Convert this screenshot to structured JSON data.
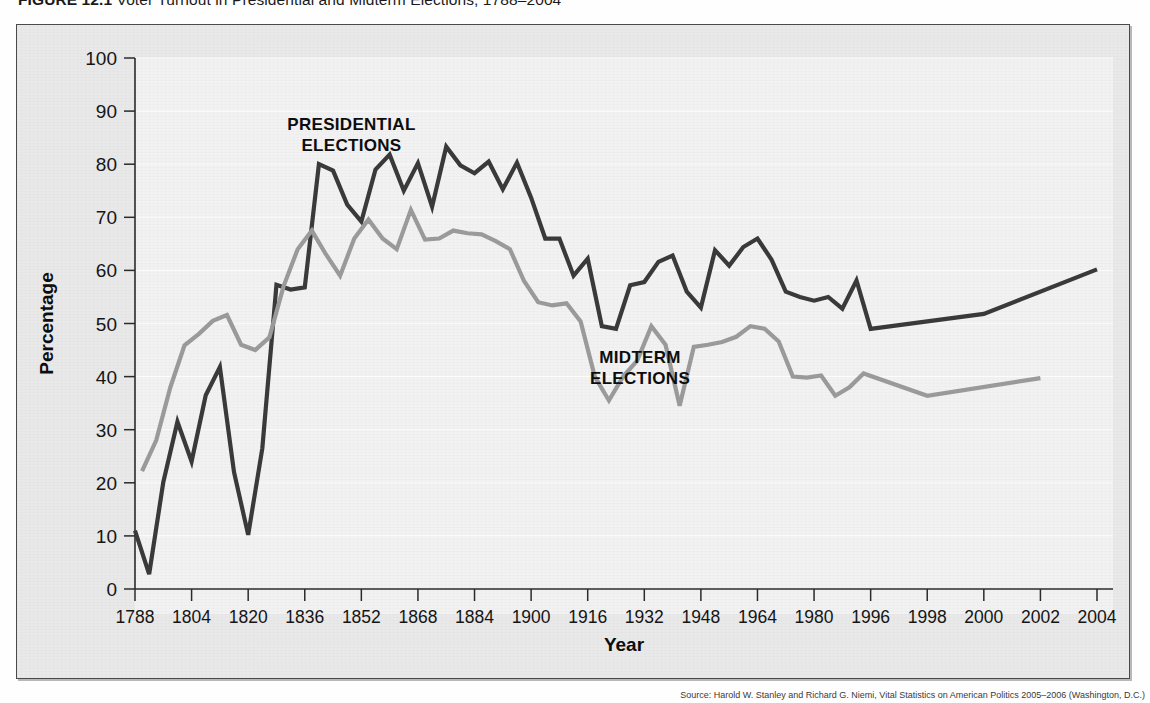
{
  "caption": {
    "number": "FIGURE 12.1",
    "title": "Voter Turnout in Presidential and Midterm Elections, 1788–2004"
  },
  "source": {
    "text": "Source: Harold W. Stanley and Richard G. Niemi, Vital Statistics on American Politics 2005–2006 (Washington, D.C.)"
  },
  "colors": {
    "presidential_line": "#3a3a3a",
    "midterm_line": "#9b9b9b",
    "plot_background": "#f2f2f2",
    "frame_background": "#e9e9e9",
    "axis": "#2b2b2b",
    "gridline": "#ffffff"
  },
  "chart_data": {
    "type": "line",
    "title": "Voter Turnout in Presidential and Midterm Elections",
    "xlabel": "Year",
    "ylabel": "Percentage",
    "ylim": [
      0,
      100
    ],
    "ytick_labels": [
      "0",
      "10",
      "20",
      "30",
      "40",
      "50",
      "60",
      "70",
      "80",
      "90",
      "100"
    ],
    "ytick_values": [
      0,
      10,
      20,
      30,
      40,
      50,
      60,
      70,
      80,
      90,
      100
    ],
    "xtick_labels": [
      "1788",
      "1804",
      "1820",
      "1836",
      "1852",
      "1868",
      "1884",
      "1900",
      "1916",
      "1932",
      "1948",
      "1964",
      "1980",
      "1996",
      "1998",
      "2000",
      "2002",
      "2004"
    ],
    "grid": "horizontal",
    "legend_position": "inline-annotations",
    "annotations": [
      {
        "text": "PRESIDENTIAL\nELECTIONS",
        "line1": "PRESIDENTIAL",
        "line2": "ELECTIONS",
        "x_frac": 0.225,
        "y_frac": 0.135
      },
      {
        "text": "MIDTERM\nELECTIONS",
        "line1": "MIDTERM",
        "line2": "ELECTIONS",
        "x_frac": 0.525,
        "y_frac": 0.575
      }
    ],
    "series": [
      {
        "name": "Presidential Elections",
        "color": "#3a3a3a",
        "stroke_width": 4.2,
        "points": [
          [
            1788,
            11.0
          ],
          [
            1792,
            2.8
          ],
          [
            1796,
            20.1
          ],
          [
            1800,
            31.5
          ],
          [
            1804,
            24.0
          ],
          [
            1808,
            36.5
          ],
          [
            1812,
            41.8
          ],
          [
            1816,
            22.0
          ],
          [
            1820,
            10.2
          ],
          [
            1824,
            26.5
          ],
          [
            1828,
            57.3
          ],
          [
            1832,
            56.4
          ],
          [
            1836,
            56.8
          ],
          [
            1840,
            80.0
          ],
          [
            1844,
            78.8
          ],
          [
            1848,
            72.4
          ],
          [
            1852,
            69.2
          ],
          [
            1856,
            79.0
          ],
          [
            1860,
            81.8
          ],
          [
            1864,
            75.0
          ],
          [
            1868,
            80.2
          ],
          [
            1872,
            72.0
          ],
          [
            1876,
            83.3
          ],
          [
            1880,
            79.8
          ],
          [
            1884,
            78.3
          ],
          [
            1888,
            80.5
          ],
          [
            1892,
            75.3
          ],
          [
            1896,
            80.3
          ],
          [
            1900,
            73.7
          ],
          [
            1904,
            66.0
          ],
          [
            1908,
            66.0
          ],
          [
            1912,
            59.0
          ],
          [
            1916,
            62.2
          ],
          [
            1920,
            49.5
          ],
          [
            1924,
            49.0
          ],
          [
            1928,
            57.2
          ],
          [
            1932,
            57.8
          ],
          [
            1936,
            61.6
          ],
          [
            1940,
            62.8
          ],
          [
            1944,
            56.0
          ],
          [
            1948,
            53.0
          ],
          [
            1952,
            63.8
          ],
          [
            1956,
            60.9
          ],
          [
            1960,
            64.4
          ],
          [
            1964,
            66.0
          ],
          [
            1968,
            62.0
          ],
          [
            1972,
            56.0
          ],
          [
            1976,
            55.0
          ],
          [
            1980,
            54.3
          ],
          [
            1984,
            55.0
          ],
          [
            1988,
            52.8
          ],
          [
            1992,
            58.1
          ],
          [
            1996,
            49.0
          ],
          [
            2000,
            51.8
          ],
          [
            2004,
            60.2
          ]
        ]
      },
      {
        "name": "Midterm Elections",
        "color": "#9b9b9b",
        "stroke_width": 4.2,
        "points": [
          [
            1790,
            22.2
          ],
          [
            1794,
            28.0
          ],
          [
            1798,
            38.0
          ],
          [
            1802,
            45.9
          ],
          [
            1806,
            48.0
          ],
          [
            1810,
            50.5
          ],
          [
            1814,
            51.6
          ],
          [
            1818,
            46.0
          ],
          [
            1822,
            45.0
          ],
          [
            1826,
            47.4
          ],
          [
            1830,
            57.0
          ],
          [
            1834,
            64.0
          ],
          [
            1838,
            67.5
          ],
          [
            1842,
            63.0
          ],
          [
            1846,
            59.0
          ],
          [
            1850,
            66.0
          ],
          [
            1854,
            69.6
          ],
          [
            1858,
            66.0
          ],
          [
            1862,
            64.0
          ],
          [
            1866,
            71.4
          ],
          [
            1870,
            65.8
          ],
          [
            1874,
            66.0
          ],
          [
            1878,
            67.5
          ],
          [
            1882,
            67.0
          ],
          [
            1886,
            66.8
          ],
          [
            1890,
            65.5
          ],
          [
            1894,
            64.0
          ],
          [
            1898,
            58.0
          ],
          [
            1902,
            54.0
          ],
          [
            1906,
            53.4
          ],
          [
            1910,
            53.8
          ],
          [
            1914,
            50.4
          ],
          [
            1918,
            40.0
          ],
          [
            1922,
            35.5
          ],
          [
            1926,
            40.0
          ],
          [
            1930,
            43.0
          ],
          [
            1934,
            49.5
          ],
          [
            1938,
            46.0
          ],
          [
            1942,
            34.5
          ],
          [
            1946,
            45.6
          ],
          [
            1950,
            46.0
          ],
          [
            1954,
            46.5
          ],
          [
            1958,
            47.5
          ],
          [
            1962,
            49.5
          ],
          [
            1966,
            49.0
          ],
          [
            1970,
            46.6
          ],
          [
            1974,
            40.0
          ],
          [
            1978,
            39.8
          ],
          [
            1982,
            40.2
          ],
          [
            1986,
            36.4
          ],
          [
            1990,
            38.0
          ],
          [
            1994,
            40.6
          ],
          [
            1998,
            36.4
          ],
          [
            2002,
            39.7
          ]
        ]
      }
    ]
  }
}
